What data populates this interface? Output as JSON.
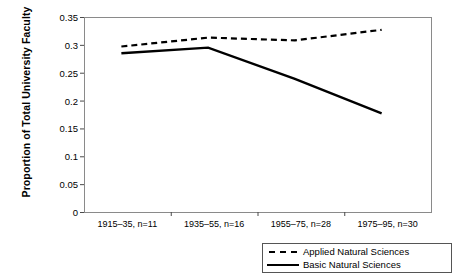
{
  "chart_data": {
    "type": "line",
    "title": "",
    "xlabel": "",
    "ylabel": "Proportion of Total University Faculty",
    "ylim": [
      0,
      0.35
    ],
    "yticks": [
      "0",
      "0.05",
      "0.1",
      "0.15",
      "0.2",
      "0.25",
      "0.3",
      "0.35"
    ],
    "ytick_values": [
      0,
      0.05,
      0.1,
      0.15,
      0.2,
      0.25,
      0.3,
      0.35
    ],
    "categories": [
      "1915–35, n=11",
      "1935–55, n=16",
      "1955–75, n=28",
      "1975–95, n=30"
    ],
    "grid": false,
    "legend_position": "bottom-right",
    "series": [
      {
        "name": "Applied Natural Sciences",
        "style": "dashed",
        "color": "#000000",
        "values": [
          0.297,
          0.313,
          0.308,
          0.327
        ]
      },
      {
        "name": "Basic Natural Sciences",
        "style": "solid",
        "color": "#000000",
        "values": [
          0.285,
          0.295,
          0.239,
          0.177
        ]
      }
    ]
  },
  "legend": {
    "items": [
      {
        "label": "Applied Natural Sciences",
        "style": "dashed"
      },
      {
        "label": "Basic Natural Sciences",
        "style": "solid"
      }
    ]
  }
}
